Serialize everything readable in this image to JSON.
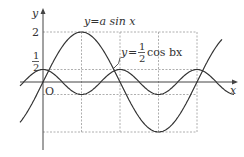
{
  "chart_data": {
    "type": "line",
    "title": "",
    "xlabel": "x",
    "ylabel": "y",
    "origin_label": "O",
    "y_tick_labels": [
      "2",
      "1/2"
    ],
    "grid": "dashed reference lines",
    "series": [
      {
        "name": "y = a sin x",
        "formula": "y = 2 sin x",
        "amplitude": 2,
        "period": "2π",
        "label": "y = a sin x"
      },
      {
        "name": "y = 1/2 cos bx",
        "formula": "y = 1/2 cos 2x",
        "amplitude": 0.5,
        "period": "π",
        "label": "y = 1/2 cos bx"
      }
    ],
    "key_points": {
      "sin_max": {
        "x": "π/2",
        "y": 2
      },
      "sin_min": {
        "x": "3π/2",
        "y": -2
      },
      "cos_max": [
        {
          "x": 0,
          "y": 0.5
        },
        {
          "x": "π",
          "y": 0.5
        }
      ],
      "cos_min": [
        {
          "x": "π/2",
          "y": -0.5
        },
        {
          "x": "3π/2",
          "y": -0.5
        }
      ]
    },
    "colors": {
      "curve": "#333333",
      "axis": "#444444",
      "grid": "#999999"
    }
  },
  "labels": {
    "y_axis": "y",
    "x_axis": "x",
    "origin": "O",
    "tick_2": "2",
    "tick_half_num": "1",
    "tick_half_den": "2",
    "sin_label_prefix": "y",
    "sin_label_eq": "=",
    "sin_label_rhs": "a sin x",
    "cos_label_prefix": "y",
    "cos_label_eq": "=",
    "cos_label_num": "1",
    "cos_label_den": "2",
    "cos_label_rhs": "cos bx"
  }
}
